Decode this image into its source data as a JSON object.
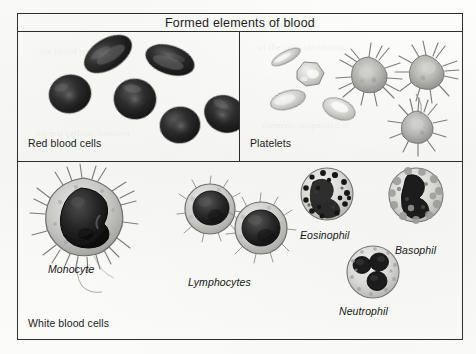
{
  "figure": {
    "title": "Formed elements of blood",
    "panels": {
      "red_blood_cells": {
        "label": "Red blood cells",
        "cell_count": 6,
        "description": "dark biconcave discs"
      },
      "platelets": {
        "label": "Platelets",
        "resting_count": 4,
        "activated_count": 3,
        "description": "pale smooth oval platelets and spiky activated platelets"
      },
      "white_blood_cells": {
        "label": "White blood cells",
        "captions": [
          {
            "name": "monocyte",
            "text": "Monocyte"
          },
          {
            "name": "lymphocytes",
            "text": "Lymphocytes"
          },
          {
            "name": "eosinophil",
            "text": "Eosinophil"
          },
          {
            "name": "basophil",
            "text": "Basophil"
          },
          {
            "name": "neutrophil",
            "text": "Neutrophil"
          }
        ]
      }
    }
  },
  "colors": {
    "border": "#2d2d2d",
    "page_background": "#fbfbfa",
    "rbc_dark": "#272727",
    "ink": "#1b1b1b"
  },
  "ghost_text": {
    "line1": "the blood stream and in",
    "line2": "of the cells circulating",
    "line3": "normal cellular function",
    "line4": "elements suspended in"
  }
}
